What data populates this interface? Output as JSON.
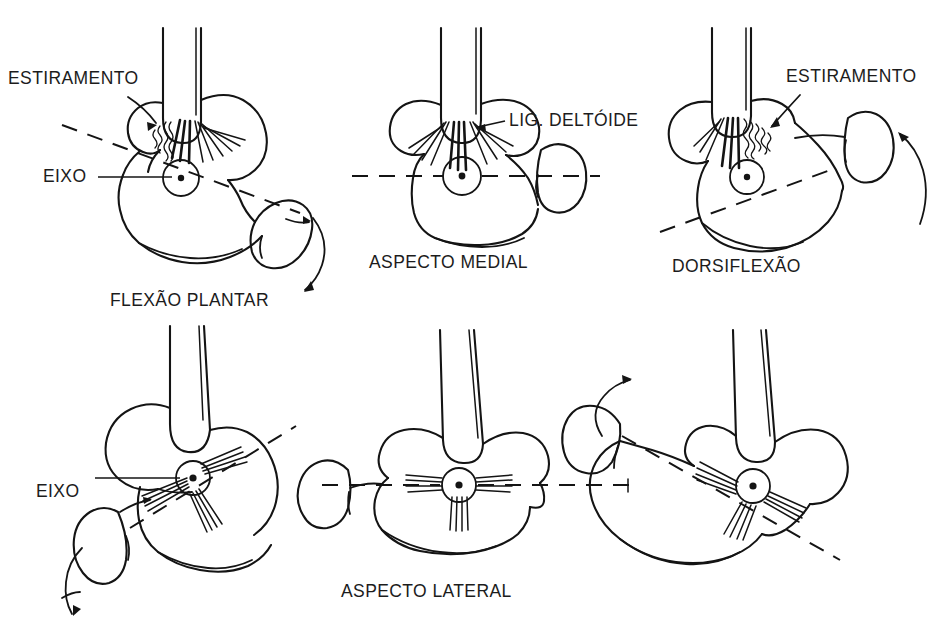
{
  "figure": {
    "title_visible": false,
    "background_color": "#ffffff",
    "ink_color": "#141414",
    "language": "pt-BR"
  },
  "panels": [
    {
      "id": "top-left",
      "caption": "FLEXÃO PLANTAR",
      "labels": [
        {
          "id": "estiramento",
          "text": "ESTIRAMENTO"
        },
        {
          "id": "eixo",
          "text": "EIXO"
        }
      ],
      "row": "medial",
      "motion": "plantar flexion",
      "has_axis_line": true,
      "has_motion_arrow": true
    },
    {
      "id": "top-center",
      "caption": "ASPECTO MEDIAL",
      "labels": [
        {
          "id": "lig-deltoide",
          "text": "LIG. DELTÓIDE"
        }
      ],
      "row": "medial",
      "motion": "neutral",
      "has_axis_line": true,
      "has_motion_arrow": false
    },
    {
      "id": "top-right",
      "caption": "DORSIFLEXÃO",
      "labels": [
        {
          "id": "estiramento",
          "text": "ESTIRAMENTO"
        }
      ],
      "row": "medial",
      "motion": "dorsiflexion",
      "has_axis_line": true,
      "has_motion_arrow": true
    },
    {
      "id": "bottom-left",
      "caption": "",
      "labels": [
        {
          "id": "eixo",
          "text": "EIXO"
        }
      ],
      "row": "lateral",
      "motion": "plantar flexion",
      "has_axis_line": true,
      "has_motion_arrow": true
    },
    {
      "id": "bottom-center",
      "caption": "ASPECTO LATERAL",
      "labels": [],
      "row": "lateral",
      "motion": "neutral",
      "has_axis_line": true,
      "has_motion_arrow": false
    },
    {
      "id": "bottom-right",
      "caption": "",
      "labels": [],
      "row": "lateral",
      "motion": "dorsiflexion",
      "has_axis_line": true,
      "has_motion_arrow": true
    }
  ],
  "text": {
    "estiramento_top_left": "ESTIRAMENTO",
    "eixo_top_left": "EIXO",
    "flexao_plantar": "FLEXÃO PLANTAR",
    "lig_deltoide": "LIG. DELTÓIDE",
    "aspecto_medial": "ASPECTO MEDIAL",
    "estiramento_top_right": "ESTIRAMENTO",
    "dorsiflexao": "DORSIFLEXÃO",
    "eixo_bottom_left": "EIXO",
    "aspecto_lateral": "ASPECTO LATERAL"
  },
  "icons": {
    "rotation_arrow": "curved-arrow-icon",
    "pointer_arrow": "arrow-pointer-icon",
    "axis_marker": "axis-dot-icon"
  }
}
